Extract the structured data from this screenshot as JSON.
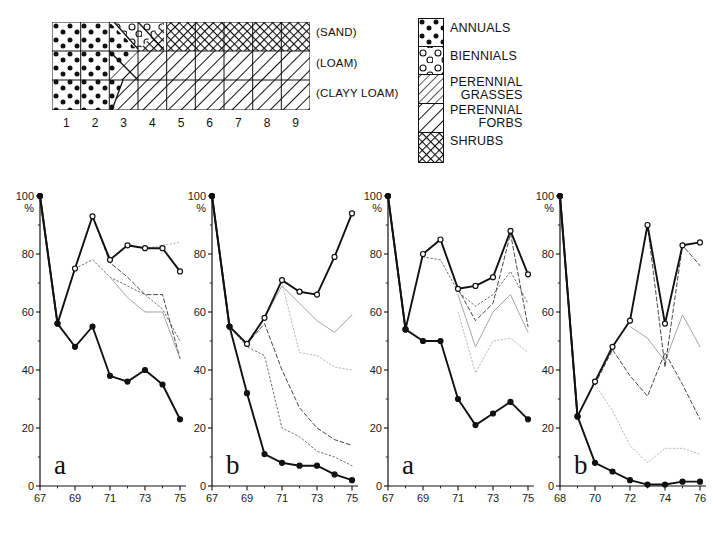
{
  "soil_diagram": {
    "name": "soil-texture-transect",
    "rows": 3,
    "cols": 9,
    "row_labels": [
      "(SAND)",
      "(LOAM)",
      "(CLAYY LOAM)"
    ],
    "column_numbers": [
      "1",
      "2",
      "3",
      "4",
      "5",
      "6",
      "7",
      "8",
      "9"
    ]
  },
  "legend": {
    "title": "",
    "items": [
      {
        "key": "annuals",
        "label": "ANNUALS",
        "label_line2": "",
        "pattern": "filled-dots"
      },
      {
        "key": "biennials",
        "label": "BIENNIALS",
        "label_line2": "",
        "pattern": "open-circles"
      },
      {
        "key": "perennial-grasses",
        "label": "PERENNIAL",
        "label_line2": "GRASSES",
        "pattern": "fine-hatch"
      },
      {
        "key": "perennial-forbs",
        "label": "PERENNIAL",
        "label_line2": "FORBS",
        "pattern": "coarse-hatch"
      },
      {
        "key": "shrubs",
        "label": "SHRUBS",
        "label_line2": "",
        "pattern": "cross-hatch"
      }
    ]
  },
  "chart_data": [
    {
      "type": "line",
      "panel": "a",
      "title": "",
      "xlabel": "",
      "ylabel": "%",
      "ylim": [
        0,
        100
      ],
      "yticks": [
        0,
        20,
        40,
        60,
        80,
        100
      ],
      "xlim": [
        67,
        75
      ],
      "xticks": [
        67,
        69,
        71,
        73,
        75
      ],
      "x": [
        67,
        68,
        69,
        70,
        71,
        72,
        73,
        74,
        75
      ],
      "series": [
        {
          "name": "total-upper",
          "style": "solid-open-marker",
          "values": [
            100,
            56,
            75,
            93,
            78,
            83,
            82,
            82,
            74
          ]
        },
        {
          "name": "annuals",
          "style": "solid-filled-marker",
          "values": [
            100,
            56,
            48,
            55,
            38,
            36,
            40,
            35,
            23
          ]
        },
        {
          "name": "cum-biennials",
          "style": "dotted",
          "values": [
            null,
            null,
            75,
            78,
            72,
            69,
            66,
            61,
            50
          ]
        },
        {
          "name": "cum-grasses",
          "style": "dashed",
          "values": [
            null,
            null,
            null,
            93,
            77,
            72,
            66,
            66,
            44
          ]
        },
        {
          "name": "cum-forbs",
          "style": "faint-solid",
          "values": [
            null,
            null,
            null,
            null,
            72,
            65,
            60,
            60,
            44
          ]
        },
        {
          "name": "cum-shrubs",
          "style": "faint-dotted",
          "values": [
            null,
            null,
            null,
            null,
            null,
            83,
            82,
            83,
            84
          ]
        }
      ]
    },
    {
      "type": "line",
      "panel": "b",
      "title": "",
      "xlabel": "",
      "ylabel": "%",
      "ylim": [
        0,
        100
      ],
      "yticks": [
        0,
        20,
        40,
        60,
        80,
        100
      ],
      "xlim": [
        67,
        75
      ],
      "xticks": [
        67,
        69,
        71,
        73,
        75
      ],
      "x": [
        67,
        68,
        69,
        70,
        71,
        72,
        73,
        74,
        75
      ],
      "series": [
        {
          "name": "total-upper",
          "style": "solid-open-marker",
          "values": [
            100,
            55,
            49,
            58,
            71,
            67,
            66,
            79,
            94
          ]
        },
        {
          "name": "annuals",
          "style": "solid-filled-marker",
          "values": [
            100,
            55,
            32,
            11,
            8,
            7,
            7,
            4,
            2
          ]
        },
        {
          "name": "cum-biennials",
          "style": "dotted",
          "values": [
            null,
            55,
            48,
            45,
            20,
            17,
            12,
            10,
            7
          ]
        },
        {
          "name": "cum-grasses",
          "style": "dashed",
          "values": [
            null,
            null,
            49,
            56,
            40,
            27,
            20,
            16,
            14
          ]
        },
        {
          "name": "cum-forbs",
          "style": "faint-solid",
          "values": [
            null,
            null,
            null,
            58,
            69,
            63,
            57,
            53,
            59
          ]
        },
        {
          "name": "cum-shrubs",
          "style": "faint-dotted",
          "values": [
            null,
            null,
            null,
            null,
            70,
            46,
            45,
            41,
            40
          ]
        }
      ]
    },
    {
      "type": "line",
      "panel": "a",
      "title": "",
      "xlabel": "",
      "ylabel": "%",
      "ylim": [
        0,
        100
      ],
      "yticks": [
        0,
        20,
        40,
        60,
        80,
        100
      ],
      "xlim": [
        67,
        75
      ],
      "xticks": [
        67,
        69,
        71,
        73,
        75
      ],
      "x": [
        67,
        68,
        69,
        70,
        71,
        72,
        73,
        74,
        75
      ],
      "series": [
        {
          "name": "total-upper",
          "style": "solid-open-marker",
          "values": [
            100,
            54,
            80,
            85,
            68,
            69,
            72,
            88,
            73
          ]
        },
        {
          "name": "annuals",
          "style": "solid-filled-marker",
          "values": [
            100,
            54,
            50,
            50,
            30,
            21,
            25,
            29,
            23
          ]
        },
        {
          "name": "cum-biennials",
          "style": "dotted",
          "values": [
            null,
            null,
            79,
            78,
            67,
            62,
            66,
            74,
            63
          ]
        },
        {
          "name": "cum-grasses",
          "style": "dashed",
          "values": [
            null,
            null,
            null,
            85,
            68,
            57,
            63,
            87,
            55
          ]
        },
        {
          "name": "cum-forbs",
          "style": "faint-solid",
          "values": [
            null,
            null,
            null,
            null,
            66,
            48,
            60,
            66,
            53
          ]
        },
        {
          "name": "cum-shrubs",
          "style": "faint-dotted",
          "values": [
            null,
            null,
            null,
            null,
            60,
            39,
            50,
            51,
            46
          ]
        }
      ]
    },
    {
      "type": "line",
      "panel": "b",
      "title": "",
      "xlabel": "",
      "ylabel": "%",
      "ylim": [
        0,
        100
      ],
      "yticks": [
        0,
        20,
        40,
        60,
        80,
        100
      ],
      "xlim": [
        68,
        76
      ],
      "xticks": [
        68,
        70,
        72,
        74,
        76
      ],
      "x": [
        68,
        69,
        70,
        71,
        72,
        73,
        74,
        75,
        76
      ],
      "series": [
        {
          "name": "total-upper",
          "style": "solid-open-marker",
          "values": [
            100,
            24,
            36,
            48,
            57,
            90,
            56,
            83,
            84
          ]
        },
        {
          "name": "annuals",
          "style": "solid-filled-marker",
          "values": [
            100,
            24,
            8,
            5,
            2,
            0.5,
            0.5,
            1.5,
            1.5
          ]
        },
        {
          "name": "cum-biennials",
          "style": "faint-dotted",
          "values": [
            null,
            null,
            35,
            26,
            14,
            8,
            13,
            13,
            11
          ]
        },
        {
          "name": "cum-grasses",
          "style": "dashed",
          "values": [
            null,
            null,
            35,
            47,
            38,
            31,
            46,
            35,
            23
          ]
        },
        {
          "name": "cum-forbs",
          "style": "faint-solid",
          "values": [
            null,
            null,
            null,
            null,
            55,
            51,
            43,
            59,
            48
          ]
        },
        {
          "name": "cum-shrubs",
          "style": "dashed-upper",
          "values": [
            null,
            null,
            null,
            null,
            null,
            90,
            41,
            83,
            76
          ]
        }
      ]
    }
  ]
}
